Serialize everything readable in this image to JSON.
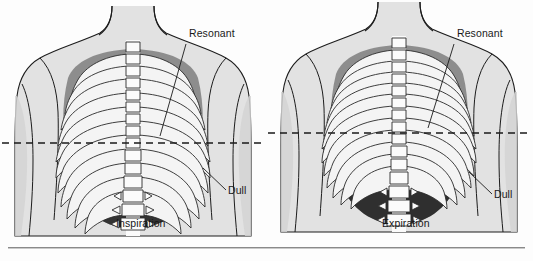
{
  "figure": {
    "background_color": "#fdfdfd",
    "ink_color": "#1a1a1a",
    "body_fill": "#e2e2e2",
    "lung_resonant_fill": "#8f8f8f",
    "lung_dull_fill": "#3a3a3a",
    "rib_fill": "#f2f2f2",
    "spine_fill": "#fafafa",
    "dashed_line_color": "#1a1a1a"
  },
  "panels": [
    {
      "id": "inspiration",
      "caption": "Inspiration",
      "caption_x": 116,
      "caption_y": 224,
      "center_x": 133,
      "dashed_line_y": 143,
      "dashed_line_x1": 2,
      "dashed_line_x2": 262,
      "labels": [
        {
          "name": "resonant-label",
          "text": "Resonant",
          "x": 189,
          "y": 33,
          "leader_x1": 186,
          "leader_y1": 44,
          "leader_x2": 160,
          "leader_y2": 136
        },
        {
          "name": "dull-label",
          "text": "Dull",
          "x": 228,
          "y": 190,
          "leader_x1": 226,
          "leader_y1": 190,
          "leader_x2": 203,
          "leader_y2": 168
        }
      ]
    },
    {
      "id": "expiration",
      "caption": "Expiration",
      "caption_x": 382,
      "caption_y": 224,
      "center_x": 399,
      "dashed_line_y": 133,
      "dashed_line_x1": 268,
      "dashed_line_x2": 531,
      "labels": [
        {
          "name": "resonant-label",
          "text": "Resonant",
          "x": 457,
          "y": 33,
          "leader_x1": 454,
          "leader_y1": 44,
          "leader_x2": 428,
          "leader_y2": 128
        },
        {
          "name": "dull-label",
          "text": "Dull",
          "x": 494,
          "y": 194,
          "leader_x1": 492,
          "leader_y1": 194,
          "leader_x2": 469,
          "leader_y2": 172
        }
      ]
    }
  ],
  "anatomy": {
    "rib_pair_count": 11,
    "vertebra_count": 16,
    "legend_note": "Shaded (dull) area marks the level of the diaphragm; resonant area marks aerated lung."
  }
}
